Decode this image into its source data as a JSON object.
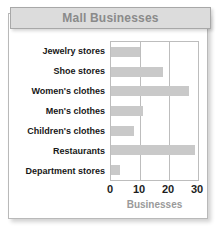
{
  "title": "Mall Businesses",
  "colors": {
    "bar_fill": "#c9c9c9",
    "title_text": "#8a8a8a",
    "title_bg": "#dcdcdc",
    "axis_label": "#9a9a9a",
    "gridline": "#bdbdbd",
    "card_border": "#b9b9b9",
    "category_text": "#171717"
  },
  "chart_data": {
    "type": "bar",
    "orientation": "horizontal",
    "title": "Mall Businesses",
    "xlabel": "Businesses",
    "ylabel": "",
    "xlim": [
      0,
      30
    ],
    "xticks": [
      0,
      10,
      20,
      30
    ],
    "grid": true,
    "legend": false,
    "categories": [
      "Jewelry stores",
      "Shoe stores",
      "Women's clothes",
      "Men's clothes",
      "Children's clothes",
      "Restaurants",
      "Department stores"
    ],
    "values": [
      10,
      18,
      27,
      11,
      8,
      29,
      3
    ]
  }
}
